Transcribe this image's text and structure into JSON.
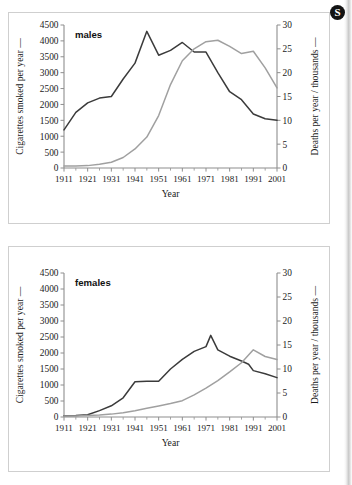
{
  "badge": {
    "label": "S",
    "name": "section-badge"
  },
  "chart_data": [
    {
      "id": "males",
      "type": "line",
      "title": "males",
      "xlabel": "Year",
      "ylabel": "Cigarettes smoked per year  —",
      "y2label": "Deaths per year / thousands  —",
      "xlim": [
        1911,
        2001
      ],
      "ylim": [
        0,
        4500
      ],
      "y2lim": [
        0,
        30
      ],
      "yticks": [
        0,
        500,
        1000,
        1500,
        2000,
        2500,
        3000,
        3500,
        4000,
        4500
      ],
      "yticklabels": [
        "0",
        "500",
        "1000",
        "1500",
        "2000",
        "2500",
        "3000",
        "3500",
        "4000",
        "4500"
      ],
      "y2ticks": [
        0,
        5,
        10,
        15,
        20,
        25,
        30
      ],
      "y2ticklabels": [
        "0",
        "5",
        "10",
        "15",
        "20",
        "25",
        "30"
      ],
      "xticks": [
        1911,
        1921,
        1931,
        1941,
        1951,
        1961,
        1971,
        1981,
        1991,
        2001
      ],
      "xticklabels": [
        "1911",
        "1921",
        "1931",
        "1941",
        "1951",
        "1961",
        "1971",
        "1981",
        "1991",
        "2001"
      ],
      "xminorticks": [
        1916,
        1926,
        1936,
        1946,
        1956,
        1966,
        1976,
        1986,
        1996
      ],
      "grid": false,
      "legend": "none",
      "series": [
        {
          "name": "Cigarettes smoked per year",
          "axis": "left",
          "color": "#3b3b3b",
          "x": [
            1911,
            1916,
            1921,
            1926,
            1931,
            1936,
            1941,
            1946,
            1951,
            1956,
            1961,
            1966,
            1971,
            1976,
            1981,
            1986,
            1991,
            1996,
            2001
          ],
          "y": [
            1200,
            1750,
            2050,
            2200,
            2250,
            2800,
            3300,
            4300,
            3550,
            3700,
            3950,
            3650,
            3650,
            3000,
            2400,
            2150,
            1700,
            1550,
            1500
          ]
        },
        {
          "name": "Deaths per year / thousands",
          "axis": "right",
          "color": "#a0a0a0",
          "x": [
            1911,
            1916,
            1921,
            1926,
            1931,
            1936,
            1941,
            1946,
            1951,
            1956,
            1961,
            1966,
            1971,
            1976,
            1981,
            1986,
            1991,
            1996,
            2001
          ],
          "y": [
            0.4,
            0.4,
            0.5,
            0.8,
            1.2,
            2.2,
            4.0,
            6.5,
            11.0,
            17.5,
            22.5,
            25.0,
            26.5,
            26.8,
            25.5,
            24.0,
            24.5,
            21.0,
            16.8
          ]
        }
      ]
    },
    {
      "id": "females",
      "type": "line",
      "title": "females",
      "xlabel": "Year",
      "ylabel": "Cigarettes smoked per year  —",
      "y2label": "Deaths per year / thousands  —",
      "xlim": [
        1911,
        2001
      ],
      "ylim": [
        0,
        4500
      ],
      "y2lim": [
        0,
        30
      ],
      "yticks": [
        0,
        500,
        1000,
        1500,
        2000,
        2500,
        3000,
        3500,
        4000,
        4500
      ],
      "yticklabels": [
        "0",
        "500",
        "1000",
        "1500",
        "2000",
        "2500",
        "3000",
        "3500",
        "4000",
        "4500"
      ],
      "y2ticks": [
        0,
        5,
        10,
        15,
        20,
        25,
        30
      ],
      "y2ticklabels": [
        "0",
        "5",
        "10",
        "15",
        "20",
        "25",
        "30"
      ],
      "xticks": [
        1911,
        1921,
        1931,
        1941,
        1951,
        1961,
        1971,
        1981,
        1991,
        2001
      ],
      "xticklabels": [
        "1911",
        "1921",
        "1931",
        "1941",
        "1951",
        "1961",
        "1971",
        "1981",
        "1991",
        "2001"
      ],
      "xminorticks": [
        1916,
        1926,
        1936,
        1946,
        1956,
        1966,
        1976,
        1986,
        1996
      ],
      "grid": false,
      "legend": "none",
      "series": [
        {
          "name": "Cigarettes smoked per year",
          "axis": "left",
          "color": "#3b3b3b",
          "x": [
            1911,
            1916,
            1921,
            1926,
            1931,
            1936,
            1941,
            1946,
            1951,
            1956,
            1961,
            1966,
            1971,
            1973,
            1976,
            1981,
            1986,
            1989,
            1991,
            1996,
            2001
          ],
          "y": [
            40,
            50,
            70,
            200,
            350,
            600,
            1100,
            1120,
            1120,
            1500,
            1800,
            2050,
            2200,
            2550,
            2100,
            1900,
            1750,
            1650,
            1450,
            1350,
            1230
          ]
        },
        {
          "name": "Deaths per year / thousands",
          "axis": "right",
          "color": "#a0a0a0",
          "x": [
            1911,
            1916,
            1921,
            1926,
            1931,
            1936,
            1941,
            1946,
            1951,
            1956,
            1961,
            1966,
            1971,
            1976,
            1981,
            1986,
            1991,
            1996,
            2001
          ],
          "y": [
            0.2,
            0.2,
            0.3,
            0.4,
            0.6,
            0.9,
            1.3,
            1.8,
            2.3,
            2.8,
            3.4,
            4.6,
            6.0,
            7.6,
            9.4,
            11.3,
            14.0,
            12.6,
            12.0
          ]
        }
      ]
    }
  ]
}
